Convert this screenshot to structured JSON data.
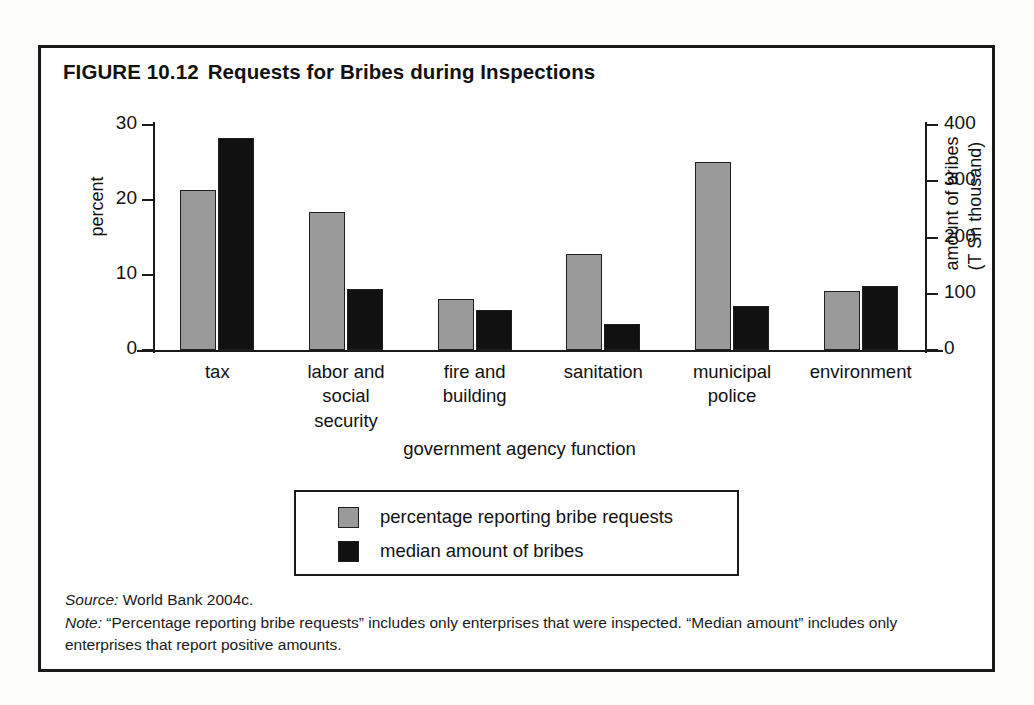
{
  "figure": {
    "number": "FIGURE 10.12",
    "title": "Requests for Bribes during Inspections",
    "source_lead": "Source:",
    "source_text": " World Bank 2004c.",
    "note_lead": "Note:",
    "note_text": " “Percentage reporting bribe requests” includes only enterprises that were inspected. “Median amount” includes only enterprises that report positive amounts."
  },
  "chart_data": {
    "type": "bar",
    "title": "Requests for Bribes during Inspections",
    "xlabel": "government agency function",
    "ylabel": "percent",
    "y2label": "amount of bribes (T Sh thousand)",
    "categories": [
      "tax",
      "labor and social security",
      "fire and building",
      "sanitation",
      "municipal police",
      "environment"
    ],
    "category_lines": [
      [
        "tax"
      ],
      [
        "labor and",
        "social",
        "security"
      ],
      [
        "fire and",
        "building"
      ],
      [
        "sanitation"
      ],
      [
        "municipal",
        "police"
      ],
      [
        "environment"
      ]
    ],
    "series": [
      {
        "name": "percentage reporting bribe requests",
        "axis": "left",
        "color": "#9a9a9a",
        "values": [
          21.3,
          18.4,
          6.8,
          12.8,
          25.1,
          7.9
        ]
      },
      {
        "name": "median amount of bribes",
        "axis": "right",
        "color": "#111111",
        "values": [
          377,
          109,
          71,
          47,
          78,
          114
        ]
      }
    ],
    "ylim": [
      0,
      30
    ],
    "yticks": [
      0,
      10,
      20,
      30
    ],
    "ytick_labels": [
      "0",
      "10",
      "20",
      "30"
    ],
    "y2lim": [
      0,
      400
    ],
    "y2ticks": [
      0,
      100,
      200,
      300,
      400
    ],
    "y2tick_labels": [
      "0",
      "100",
      "200",
      "300",
      "400"
    ],
    "grid": false,
    "legend_position": "below-center",
    "legend_entries": [
      {
        "label": "percentage reporting bribe requests",
        "swatch": "gray"
      },
      {
        "label": "median amount of bribes",
        "swatch": "black"
      }
    ]
  },
  "colors": {
    "series_gray": "#9a9a9a",
    "series_black": "#111111",
    "frame": "#1a1a1a",
    "text": "#111111",
    "background": "#ffffff"
  }
}
